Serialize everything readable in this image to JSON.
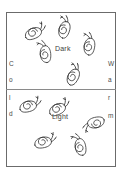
{
  "figure": {
    "panels": [
      {
        "id": "dark",
        "label": "Dark",
        "snail_count": 5
      },
      {
        "id": "light",
        "label": "Light",
        "snail_count": 5
      }
    ],
    "gradient_axes": {
      "left": {
        "word": "Cold",
        "letters": [
          {
            "char": "C",
            "x": 9,
            "y": 61
          },
          {
            "char": "o",
            "x": 9,
            "y": 77
          },
          {
            "char": "l",
            "x": 9,
            "y": 95
          },
          {
            "char": "d",
            "x": 9,
            "y": 111
          }
        ]
      },
      "right": {
        "word": "Warm",
        "letters": [
          {
            "char": "W",
            "x": 108,
            "y": 61
          },
          {
            "char": "a",
            "x": 108,
            "y": 77
          },
          {
            "char": "r",
            "x": 108,
            "y": 95
          },
          {
            "char": "m",
            "x": 108,
            "y": 113
          }
        ]
      }
    },
    "snails": [
      {
        "id": "snail-1",
        "panel": "dark",
        "x": 16,
        "y": 15,
        "rotation": -22,
        "scale": 0.86
      },
      {
        "id": "snail-2",
        "panel": "dark",
        "x": 46,
        "y": 12,
        "rotation": -72,
        "scale": 0.86
      },
      {
        "id": "snail-3",
        "panel": "dark",
        "x": 71,
        "y": 29,
        "rotation": -80,
        "scale": 0.86
      },
      {
        "id": "snail-4",
        "panel": "dark",
        "x": 27,
        "y": 37,
        "rotation": -95,
        "scale": 0.86
      },
      {
        "id": "snail-5",
        "panel": "dark",
        "x": 55,
        "y": 59,
        "rotation": -62,
        "scale": 0.86
      },
      {
        "id": "snail-6",
        "panel": "light",
        "x": 11,
        "y": 88,
        "rotation": -14,
        "scale": 0.86
      },
      {
        "id": "snail-7",
        "panel": "light",
        "x": 40,
        "y": 91,
        "rotation": -25,
        "scale": 0.86
      },
      {
        "id": "snail-8",
        "panel": "light",
        "x": 79,
        "y": 107,
        "rotation": 168,
        "scale": 0.86
      },
      {
        "id": "snail-9",
        "panel": "light",
        "x": 26,
        "y": 124,
        "rotation": -12,
        "scale": 0.86
      },
      {
        "id": "snail-10",
        "panel": "light",
        "x": 62,
        "y": 130,
        "rotation": -100,
        "scale": 0.86
      }
    ]
  },
  "colors": {
    "ink": "#3d3d3d",
    "frame": "#6b6b6b",
    "divider": "#8a8a8a",
    "background": "#ffffff"
  }
}
